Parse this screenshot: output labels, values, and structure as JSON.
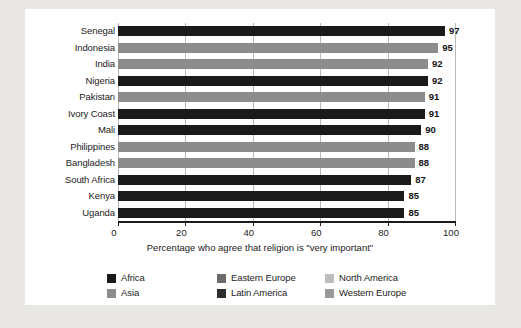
{
  "chart_data": {
    "type": "bar",
    "orientation": "horizontal",
    "title": "",
    "xlabel": "Percentage who agree that religion is \"very important\"",
    "ylabel": "",
    "xlim": [
      0,
      100
    ],
    "xticks": [
      0,
      20,
      40,
      60,
      80,
      100
    ],
    "grid": true,
    "legend_position": "bottom",
    "categories": [
      "Senegal",
      "Indonesia",
      "India",
      "Nigeria",
      "Pakistan",
      "Ivory Coast",
      "Mali",
      "Philippines",
      "Bangladesh",
      "South Africa",
      "Kenya",
      "Uganda"
    ],
    "values": [
      97,
      95,
      92,
      92,
      91,
      91,
      90,
      88,
      88,
      87,
      85,
      85
    ],
    "bar_groups": [
      "Africa",
      "Asia",
      "Asia",
      "Africa",
      "Asia",
      "Africa",
      "Africa",
      "Asia",
      "Asia",
      "Africa",
      "Africa",
      "Africa"
    ],
    "data_labels": [
      "97",
      "95",
      "92",
      "92",
      "91",
      "91",
      "90",
      "88",
      "88",
      "87",
      "85",
      "85"
    ],
    "legend": [
      {
        "label": "Africa",
        "color": "#1a1a1a"
      },
      {
        "label": "Asia",
        "color": "#8c8c8c"
      },
      {
        "label": "Eastern Europe",
        "color": "#6b6b6b"
      },
      {
        "label": "Latin America",
        "color": "#2e2e2e"
      },
      {
        "label": "North America",
        "color": "#bdbdbd"
      },
      {
        "label": "Western Europe",
        "color": "#9a9a9a"
      }
    ],
    "tick_labels": [
      "0",
      "20",
      "40",
      "60",
      "80",
      "100"
    ]
  },
  "palette": {
    "page_background": "#e9e7e3",
    "card_background": "#ffffff",
    "axis": "#1b1b1b",
    "gridline": "#b9b9b9",
    "text": "#1b1b1b"
  }
}
